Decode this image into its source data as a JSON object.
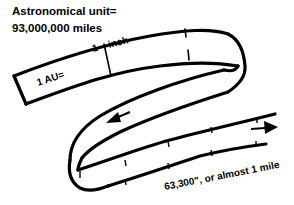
{
  "title": {
    "line1": "Astronomical unit=",
    "line2": "93,000,000 miles"
  },
  "tape": {
    "scale_label": "1 AU=",
    "tick_number": "1",
    "tick_unit": "inch",
    "length_label": "63,300\", or almost 1 mile"
  },
  "icons": {
    "left_arrow": "arrow-left",
    "right_arrow": "arrow-right"
  },
  "colors": {
    "ink": "#000000",
    "paper": "#ffffff"
  }
}
